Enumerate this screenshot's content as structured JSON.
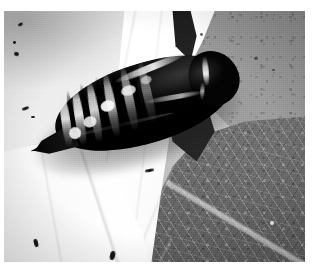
{
  "image": {
    "kind": "photograph",
    "subject": "moth pupa (chrysalis) resting on leaves",
    "color_mode": "black and white",
    "orientation": "landscape",
    "caption": "Close-up black-and-white photograph of a dark, glossy moth pupa lying diagonally across overlapping leaves",
    "dimensions": {
      "width": 314,
      "height": 266
    },
    "border": {
      "color": "#ffffff",
      "top": 11,
      "left": 4,
      "right": 9,
      "bottom": 4
    }
  },
  "palette": {
    "pupa_dark": "#0b0b0b",
    "pupa_highlight": "#f2f2f2",
    "leaf_white": "#f7f7f7",
    "leaf_light_gray": "#d8d8d8",
    "leaf_mid_gray": "#9b9b9b",
    "leaf_dark_gray": "#6d6d6d",
    "shadow": "#161616",
    "border_white": "#ffffff"
  },
  "subject": {
    "name": "pupa",
    "label": "moth pupa",
    "position": {
      "x": 22,
      "y": 48,
      "width": 214,
      "height": 96
    },
    "rotation_deg": -17,
    "parts": [
      {
        "name": "abdomen",
        "label": "segmented abdomen"
      },
      {
        "name": "cremaster",
        "label": "pointed abdominal tip"
      },
      {
        "name": "head-thorax",
        "label": "rounded head and thorax"
      },
      {
        "name": "wing-case",
        "label": "wing case"
      }
    ],
    "segment_count": 6,
    "segment_rings": [
      {
        "name": "segment-ring-1",
        "opacity": 0.92
      },
      {
        "name": "segment-ring-2",
        "opacity": 0.95
      },
      {
        "name": "segment-ring-3",
        "opacity": 0.88
      },
      {
        "name": "segment-ring-4",
        "opacity": 0.8
      },
      {
        "name": "segment-ring-5",
        "opacity": 0.62
      },
      {
        "name": "segment-ring-6",
        "opacity": 0.42
      }
    ],
    "highlights": [
      "specular-highlight-a",
      "specular-highlight-b",
      "specular-highlight-c",
      "specular-highlight-d",
      "specular-highlight-e",
      "dorsal-highlight",
      "wing-case-highlight",
      "head-streak-highlight"
    ]
  },
  "background": {
    "regions": [
      {
        "name": "leaf-upper-left",
        "label": "pale leaf blade, upper left",
        "tone": "light gray"
      },
      {
        "name": "leaf-white-center",
        "label": "bright white leaf wedge",
        "tone": "white"
      },
      {
        "name": "leaf-upper-right",
        "label": "mid-gray leaf, upper right",
        "tone": "medium gray"
      },
      {
        "name": "leaf-lower-right",
        "label": "dark textured leaf, lower right",
        "tone": "dark gray"
      },
      {
        "name": "leaf-lower-left",
        "label": "bright leaf blade, lower left",
        "tone": "white"
      },
      {
        "name": "shadow-wedge",
        "label": "dark shadow where leaves overlap",
        "tone": "black"
      }
    ],
    "veins": [
      "vein-vertical-right",
      "vein-horizontal-right",
      "vein-diagonal-lower",
      "veins-white-leaf",
      "veins-lower-left"
    ],
    "debris_specks": 12
  }
}
